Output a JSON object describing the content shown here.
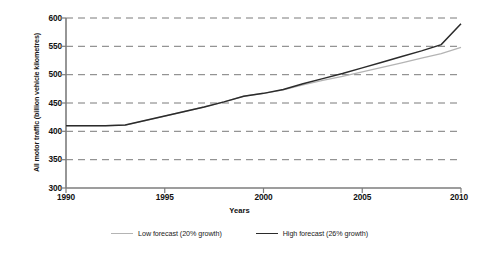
{
  "chart_data": {
    "type": "line",
    "title": "",
    "xlabel": "Years",
    "ylabel": "All motor traffic (billion vehicle kilometres)",
    "xlim": [
      1990,
      2010
    ],
    "ylim": [
      300,
      600
    ],
    "yticks": [
      600,
      550,
      500,
      450,
      400,
      350,
      300
    ],
    "xticks": [
      1990,
      1995,
      2000,
      2005,
      2010
    ],
    "grid": "horizontal-dashed",
    "legend_position": "bottom-center",
    "x": [
      1990,
      1991,
      1992,
      1993,
      1994,
      1995,
      1996,
      1997,
      1998,
      1999,
      2000,
      2001,
      2002,
      2003,
      2004,
      2005,
      2006,
      2007,
      2008,
      2009,
      2010
    ],
    "series": [
      {
        "name": "Low forecast (20% growth)",
        "color": "#b4b4b4",
        "values": [
          410,
          410,
          410,
          411,
          419,
          427,
          435,
          443,
          452,
          462,
          467,
          473,
          482,
          490,
          497,
          505,
          513,
          521,
          529,
          537,
          548
        ]
      },
      {
        "name": "High forecast (26% growth)",
        "color": "#2b2b2b",
        "values": [
          410,
          410,
          410,
          411,
          419,
          427,
          435,
          443,
          452,
          462,
          467,
          474,
          484,
          493,
          502,
          512,
          522,
          532,
          542,
          553,
          590
        ]
      }
    ]
  },
  "legend": {
    "entries": [
      {
        "label": "Low forecast (20% growth)"
      },
      {
        "label": "High forecast (26% growth)"
      }
    ]
  },
  "axes": {
    "y_title": "All motor traffic (billion vehicle kilometres)",
    "x_title": "Years",
    "y_tick_labels": [
      "600",
      "550",
      "500",
      "450",
      "400",
      "350",
      "300"
    ],
    "x_tick_labels": [
      "1990",
      "1995",
      "2000",
      "2005",
      "2010"
    ]
  },
  "colors": {
    "low_line": "#b4b4b4",
    "high_line": "#2b2b2b",
    "grid": "#808080",
    "axis": "#808080",
    "text": "#111111"
  }
}
